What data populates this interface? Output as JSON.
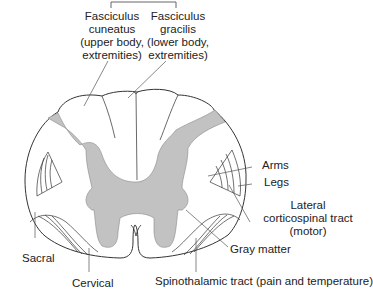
{
  "colors": {
    "gray_matter": "#c2c2c2",
    "outline": "#333333",
    "background": "#ffffff"
  },
  "labels": {
    "fasciculus_cuneatus": [
      "Fasciculus",
      "cuneatus",
      "(upper body,",
      "extremities)"
    ],
    "fasciculus_gracilis": [
      "Fasciculus",
      "gracilis",
      "(lower body,",
      "extremities)"
    ],
    "arms": "Arms",
    "legs": "Legs",
    "lateral_corticospinal": [
      "Lateral",
      "corticospinal tract",
      "(motor)"
    ],
    "gray_matter": "Gray matter",
    "sacral": "Sacral",
    "cervical": "Cervical",
    "spinothalamic": "Spinothalamic tract (pain and temperature)"
  }
}
